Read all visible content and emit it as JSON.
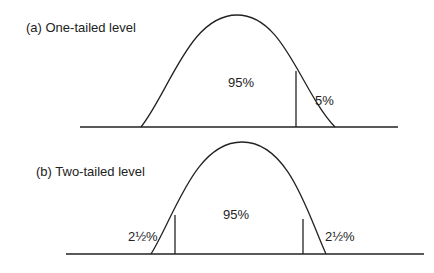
{
  "panels": [
    {
      "label": "(a)  One-tailed level",
      "center_pct": "95%",
      "tail_right_pct": "5%"
    },
    {
      "label": "(b)  Two-tailed level",
      "center_pct": "95%",
      "tail_left_pct": "2½%",
      "tail_right_pct": "2½%"
    }
  ]
}
